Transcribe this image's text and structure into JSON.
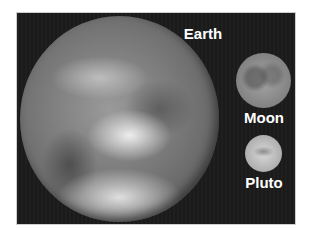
{
  "scene": {
    "title": "Size comparison of Earth, Moon and Pluto",
    "background_color": "#1b1b1b",
    "bodies": [
      {
        "name": "Earth",
        "label": "Earth"
      },
      {
        "name": "Moon",
        "label": "Moon"
      },
      {
        "name": "Pluto",
        "label": "Pluto"
      }
    ]
  }
}
